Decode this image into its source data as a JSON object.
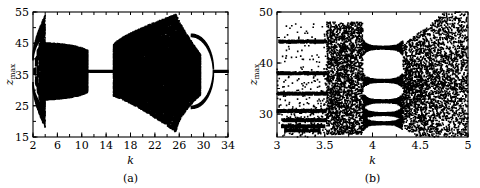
{
  "figure": {
    "panels": [
      {
        "id": "a",
        "caption": "(a)",
        "xlabel": "k",
        "ylabel": "z",
        "ylabel_sub": "max",
        "xticks": [
          "2",
          "6",
          "10",
          "14",
          "18",
          "22",
          "26",
          "30",
          "34"
        ],
        "xtick_values": [
          2,
          6,
          10,
          14,
          18,
          22,
          26,
          30,
          34
        ],
        "yticks": [
          "15",
          "25",
          "35",
          "45",
          "55"
        ],
        "ytick_values": [
          15,
          25,
          35,
          45,
          55
        ],
        "xlim": [
          2,
          34
        ],
        "ylim": [
          15,
          55
        ],
        "minor_x_step": 2,
        "minor_y_step": 5
      },
      {
        "id": "b",
        "caption": "(b)",
        "xlabel": "k",
        "ylabel": "z",
        "ylabel_sub": "max",
        "xticks": [
          "3",
          "3.5",
          "4",
          "4.5",
          "5"
        ],
        "xtick_values": [
          3,
          3.5,
          4,
          4.5,
          5
        ],
        "yticks": [
          "30",
          "40",
          "50"
        ],
        "ytick_values": [
          30,
          40,
          50
        ],
        "xlim": [
          3,
          5
        ],
        "ylim": [
          25.5,
          50
        ],
        "minor_x_step": 0.25,
        "minor_y_step": 5
      }
    ]
  },
  "chart_data": [
    {
      "type": "scatter",
      "panel": "a",
      "title": "",
      "xlabel": "k",
      "ylabel": "z_max",
      "xlim": [
        2,
        34
      ],
      "ylim": [
        15,
        55
      ],
      "grid": false,
      "legend": null,
      "description": "Bifurcation diagram of z_max versus control parameter k. Chaotic band from k=2 to k=11, periodic window near k=11-15, broad chaotic region k=15-29 reaching widest extent near k=27, reverse period-doubling bubble closing at k~31.5, single branch to k=34.",
      "point_color": "#000000",
      "point_size": 0.55,
      "regions": [
        {
          "name": "cascade-striations",
          "k_start": 2.0,
          "k_end": 4.0,
          "z_low": 17.0,
          "z_high": 47.5,
          "style": "striped",
          "density": 0.95
        },
        {
          "name": "chaotic-band-left",
          "k_start": 4.0,
          "k_end": 11.0,
          "z_low": 27.0,
          "z_high": 45.0,
          "style": "filled",
          "density": 1.0
        },
        {
          "name": "periodic-window",
          "k_start": 11.0,
          "k_end": 15.2,
          "z_low": 35.6,
          "z_high": 36.4,
          "style": "line",
          "density": 1.0
        },
        {
          "name": "chaotic-band-right",
          "k_start": 15.2,
          "k_end": 29.5,
          "z_low": 16.0,
          "z_high": 54.0,
          "style": "filled",
          "density": 1.0
        },
        {
          "name": "bubble-upper-branch",
          "k_start": 28.0,
          "k_end": 31.6,
          "z_low": 36.0,
          "z_high": 47.0,
          "style": "branch",
          "density": 1.0
        },
        {
          "name": "bubble-lower-branch",
          "k_start": 28.0,
          "k_end": 31.6,
          "z_low": 21.0,
          "z_high": 36.0,
          "style": "branch",
          "density": 1.0
        },
        {
          "name": "single-branch",
          "k_start": 31.6,
          "k_end": 34.0,
          "z_low": 35.6,
          "z_high": 36.4,
          "style": "line",
          "density": 1.0
        }
      ]
    },
    {
      "type": "scatter",
      "panel": "b",
      "title": "",
      "xlabel": "k",
      "ylabel": "z_max",
      "xlim": [
        3,
        5
      ],
      "ylim": [
        25.5,
        50
      ],
      "grid": false,
      "legend": null,
      "description": "Magnification of the bifurcation diagram for k between 3 and 5. Discrete periodic branches at z~44, 38, 34, 30.5 and a dense cluster near z=27-29 for k<3.5, chaotic scatter from k=3.5 to 3.9, a period-5 window from k=3.9 to 4.3, then broad chaos to k=5.",
      "point_color": "#000000",
      "point_size": 0.55,
      "branches": [
        {
          "z": 44.2,
          "k_start": 3.02,
          "k_end": 3.52
        },
        {
          "z": 38.0,
          "k_start": 3.0,
          "k_end": 3.52
        },
        {
          "z": 34.0,
          "k_start": 3.0,
          "k_end": 3.52
        },
        {
          "z": 30.6,
          "k_start": 3.0,
          "k_end": 3.52
        },
        {
          "z": 28.8,
          "k_start": 3.05,
          "k_end": 3.52
        },
        {
          "z": 27.6,
          "k_start": 3.05,
          "k_end": 3.5
        },
        {
          "z": 26.8,
          "k_start": 3.08,
          "k_end": 3.45
        }
      ],
      "regions": [
        {
          "name": "chaotic-scatter-left",
          "k_start": 3.52,
          "k_end": 3.9,
          "z_low": 26.0,
          "z_high": 48.0,
          "style": "scatter",
          "density": 0.55
        },
        {
          "name": "period-window-bands",
          "k_start": 3.9,
          "k_end": 4.32,
          "z_low": 26.5,
          "z_high": 43.5,
          "style": "bands",
          "density": 1.0
        },
        {
          "name": "chaotic-scatter-right",
          "k_start": 4.32,
          "k_end": 5.0,
          "z_low": 26.0,
          "z_high": 48.0,
          "style": "scatter",
          "density": 0.5
        }
      ],
      "window_bands": [
        43.0,
        36.5,
        32.5,
        30.0,
        28.2
      ]
    }
  ]
}
